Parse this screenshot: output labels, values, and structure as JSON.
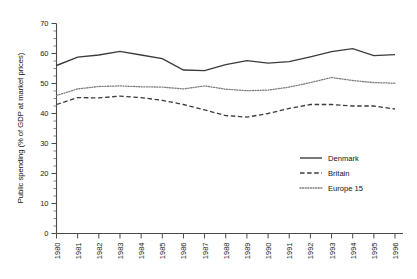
{
  "chart_data": {
    "type": "line",
    "title": "",
    "xlabel": "",
    "ylabel": "Public spending (% of GDP at market prices)",
    "ylim": [
      0,
      70
    ],
    "ytick_step": 10,
    "yticks": [
      "0",
      "10",
      "20",
      "30",
      "40",
      "50",
      "60",
      "70"
    ],
    "grid": false,
    "legend_position": "right-middle",
    "categories": [
      "1980",
      "1981",
      "1982",
      "1983",
      "1984",
      "1985",
      "1986",
      "1987",
      "1988",
      "1989",
      "1990",
      "1991",
      "1992",
      "1993",
      "1994",
      "1995",
      "1996"
    ],
    "series": [
      {
        "name": "Denmark",
        "style": "solid",
        "color": "#3b3b3b",
        "values": [
          56.0,
          58.8,
          59.5,
          60.7,
          59.5,
          58.3,
          54.5,
          54.3,
          56.3,
          57.6,
          56.8,
          57.3,
          58.9,
          60.6,
          61.6,
          59.3,
          59.6
        ]
      },
      {
        "name": "Britain",
        "style": "dashed",
        "color": "#3b3b3b",
        "values": [
          43.0,
          45.3,
          45.2,
          45.8,
          45.3,
          44.4,
          43.0,
          41.2,
          39.3,
          38.8,
          40.0,
          41.7,
          43.0,
          43.0,
          42.5,
          42.5,
          41.5
        ]
      },
      {
        "name": "Europe 15",
        "style": "dotted",
        "color": "#7d7d7d",
        "values": [
          46.0,
          48.2,
          49.0,
          49.2,
          48.9,
          48.8,
          48.2,
          49.2,
          48.1,
          47.6,
          47.8,
          48.8,
          50.3,
          52.0,
          51.0,
          50.3,
          50.1
        ]
      }
    ]
  },
  "legend": {
    "items": [
      {
        "label": "Denmark"
      },
      {
        "label": "Britain"
      },
      {
        "label": "Europe 15"
      }
    ]
  }
}
